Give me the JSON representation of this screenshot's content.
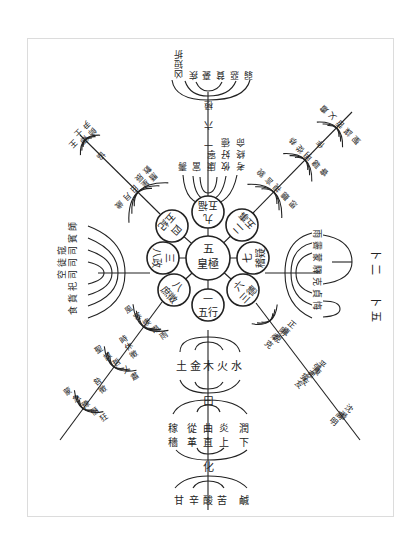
{
  "center": {
    "number": "五",
    "label": "皇極",
    "x": 208,
    "y": 258,
    "r": 22
  },
  "categories": [
    {
      "id": "one",
      "number": "一",
      "label": "五行",
      "angle": 180,
      "children": {
        "level1": [
          "水",
          "火",
          "木",
          "金",
          "土"
        ],
        "connector1": "曰",
        "level2": [
          "潤下",
          "炎上",
          "曲直",
          "從革",
          "稼穡"
        ],
        "connector2": "化",
        "level3": [
          "鹹",
          "苦",
          "酸",
          "辛",
          "甘"
        ]
      }
    },
    {
      "id": "two",
      "number": "二",
      "label": "五事",
      "angle": 45,
      "items": [
        "貌",
        "言",
        "視",
        "聽",
        "思"
      ],
      "subitems": [
        "恭",
        "從",
        "明",
        "聰",
        "睿"
      ],
      "outcomes": [
        "肅",
        "乂",
        "哲",
        "謀",
        "聖"
      ]
    },
    {
      "id": "three",
      "number": "三",
      "label": "八政",
      "angle": -90,
      "items": [
        "食",
        "貨",
        "祀",
        "司空",
        "司徒",
        "司寇",
        "賓",
        "師"
      ]
    },
    {
      "id": "four",
      "number": "四",
      "label": "五紀",
      "angle": -45,
      "items": [
        "歲",
        "月",
        "日",
        "星辰",
        "曆數"
      ],
      "next": "協",
      "sub": [
        "王",
        "卿士",
        "師尹"
      ]
    },
    {
      "id": "six",
      "number": "六",
      "label": "三德",
      "angle": 135,
      "items": [
        "正直",
        "剛克",
        "柔克"
      ],
      "sub": [
        "平康",
        "彊弗友",
        "燮友"
      ],
      "sub2": [
        "沈潛",
        "高明"
      ]
    },
    {
      "id": "seven",
      "number": "七",
      "label": "稽疑",
      "angle": 90,
      "items": [
        "雨",
        "霽",
        "蒙",
        "驛",
        "克",
        "貞",
        "悔"
      ],
      "groups": [
        {
          "label": "卜",
          "count": "二"
        },
        {
          "label": "卜",
          "count": "五"
        }
      ]
    },
    {
      "id": "eight",
      "number": "八",
      "label": "庶徵",
      "angle": -135,
      "items": [
        "雨",
        "暘",
        "燠",
        "寒",
        "風"
      ],
      "next": "時休徵",
      "sub": [
        "肅",
        "乂",
        "哲",
        "謀",
        "聖"
      ],
      "next2": "咎徵",
      "sub2": [
        "狂",
        "僭",
        "豫",
        "急",
        "蒙"
      ]
    },
    {
      "id": "nine",
      "number": "九",
      "label": "五福",
      "angle": 0,
      "items": [
        "壽",
        "富",
        "康寧",
        "攸好德",
        "考終命"
      ],
      "next": "六極",
      "sub": [
        "凶短折",
        "疾",
        "憂",
        "貧",
        "惡",
        "弱"
      ]
    }
  ],
  "top_branch": {
    "words_row1": [
      "考",
      "攸",
      "康",
      "富",
      "壽"
    ],
    "words_row2": [
      "終",
      "好",
      "寧"
    ],
    "words_row3": [
      "命",
      "德"
    ],
    "connector": "一 六 極",
    "sub": [
      "弱",
      "惡",
      "貧",
      "憂",
      "疾",
      "凶短折"
    ]
  },
  "right_upper_branch": {
    "row1": [
      "貌",
      "言",
      "視",
      "聽",
      "思"
    ],
    "row2": [
      "恭",
      "從",
      "明",
      "聰",
      "睿"
    ],
    "connector": "作",
    "row3": [
      "肅",
      "乂",
      "哲",
      "謀",
      "聖"
    ]
  },
  "left_upper_branch": {
    "row1": [
      "歲",
      "月",
      "日",
      "星辰",
      "曆數"
    ],
    "connector": "協",
    "row2": [
      "王",
      "卿士",
      "師尹"
    ]
  },
  "left_branch": [
    "師",
    "賓",
    "司寇",
    "司徒",
    "司空",
    "祀",
    "貨",
    "食"
  ],
  "right_branch": {
    "items": [
      "雨",
      "霽",
      "蒙",
      "驛",
      "克",
      "貞",
      "悔"
    ],
    "group1": "卜 二",
    "group2": "卜 五"
  },
  "right_lower_branch": {
    "row1": [
      "正直",
      "剛克",
      "柔克"
    ],
    "row2": [
      "平康",
      "彊弗友",
      "燮友"
    ],
    "row3": [
      "沈潛",
      "高明"
    ]
  },
  "left_lower_branch": {
    "row1": [
      "雨",
      "暘",
      "燠",
      "寒",
      "風"
    ],
    "connector1": "時休徵",
    "row2": [
      "肅",
      "乂",
      "哲",
      "謀",
      "聖"
    ],
    "connector2": "咎徵",
    "row3": [
      "狂",
      "僭",
      "豫",
      "急",
      "蒙"
    ]
  },
  "bottom_branch": {
    "row1": [
      "土",
      "金",
      "木",
      "火",
      "水"
    ],
    "connector1": "曰",
    "row2_top": [
      "稼",
      "從",
      "曲",
      "炎",
      "潤"
    ],
    "row2_bottom": [
      "穡",
      "革",
      "直",
      "上",
      "下"
    ],
    "connector2": "化",
    "row3": [
      "甘",
      "辛",
      "酸",
      "苦",
      "鹹"
    ]
  },
  "colors": {
    "ink": "#222222",
    "frame": "#dcdcdc",
    "background": "#ffffff"
  }
}
